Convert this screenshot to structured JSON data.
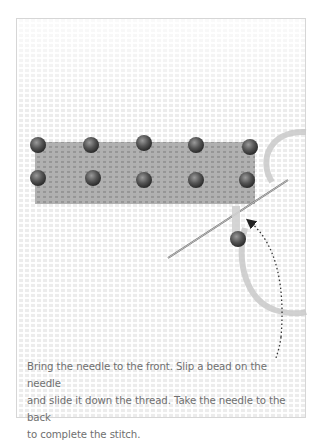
{
  "illustration": {
    "subject": "bead stitch on needlepoint canvas",
    "colors": {
      "canvas": "#ececec",
      "stitched_area": "#a9a9a9",
      "bead": "#555555",
      "thread": "#c4c4c4",
      "needle": "#8a8a8a",
      "arrow": "#333333"
    },
    "bead_rows": [
      {
        "row": 1,
        "count": 5
      },
      {
        "row": 2,
        "count": 5
      }
    ],
    "loose_bead_count": 1,
    "arrow": "dotted-curved-arrow"
  },
  "caption": {
    "line1": "Bring the needle to the front. Slip a bead on the needle",
    "line2": "and slide it down the thread. Take the needle to the back",
    "line3": "to complete the stitch."
  }
}
